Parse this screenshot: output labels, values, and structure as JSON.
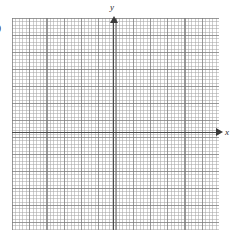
{
  "figure": {
    "type": "coordinate-grid",
    "background_color": "#ffffff",
    "axis_color": "#4a4a4a",
    "major_grid_color": "#787878",
    "minor_grid_color": "#969696"
  },
  "axes": {
    "x_label": "x",
    "y_label": "y",
    "x_arrow": "arrow-right",
    "y_arrow": "arrow-up"
  },
  "edge_text": {
    "clipped_label": "0"
  },
  "chart_data": {
    "type": "scatter",
    "title": "",
    "xlabel": "x",
    "ylabel": "y",
    "series": [],
    "x": [],
    "values": [],
    "xlim": [
      -6,
      6
    ],
    "ylim": [
      -5.5,
      6.5
    ],
    "grid": true,
    "minor_grid": true,
    "major_gridlines_x": 12,
    "major_gridlines_y": 12,
    "minor_per_major": 5,
    "legend": "none",
    "annotations": []
  }
}
